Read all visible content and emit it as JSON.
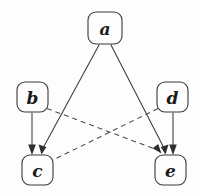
{
  "figure": {
    "type": "node-link-diagram",
    "background_color": "#fdfdfd",
    "stroke_color": "#3a3a3a",
    "width": 200,
    "height": 194
  },
  "nodes": [
    {
      "id": "a",
      "label": "a",
      "x": 105,
      "y": 28,
      "w": 34,
      "h": 32
    },
    {
      "id": "b",
      "label": "b",
      "x": 33,
      "y": 97,
      "w": 31,
      "h": 30
    },
    {
      "id": "d",
      "label": "d",
      "x": 171,
      "y": 97,
      "w": 31,
      "h": 30
    },
    {
      "id": "c",
      "label": "c",
      "x": 37,
      "y": 170,
      "w": 31,
      "h": 30
    },
    {
      "id": "e",
      "label": "e",
      "x": 170,
      "y": 170,
      "w": 31,
      "h": 30
    }
  ],
  "edges": [
    {
      "from": "a",
      "to": "c",
      "style": "solid",
      "arrow": true,
      "x1": 99,
      "y1": 45,
      "x2": 43,
      "y2": 152
    },
    {
      "from": "a",
      "to": "e",
      "style": "solid",
      "arrow": true,
      "x1": 111,
      "y1": 45,
      "x2": 164,
      "y2": 152
    },
    {
      "from": "b",
      "to": "c",
      "style": "solid",
      "arrow": true,
      "x1": 32,
      "y1": 113,
      "x2": 32,
      "y2": 152
    },
    {
      "from": "d",
      "to": "e",
      "style": "solid",
      "arrow": true,
      "x1": 173,
      "y1": 113,
      "x2": 173,
      "y2": 152
    },
    {
      "from": "b",
      "to": "e",
      "style": "dashed",
      "arrow": true,
      "x1": 48,
      "y1": 109,
      "x2": 158,
      "y2": 153
    },
    {
      "from": "d",
      "to": "c",
      "style": "dashed",
      "arrow": false,
      "x1": 157,
      "y1": 109,
      "x2": 54,
      "y2": 160
    }
  ],
  "legend": {
    "solid_meaning": "directed edge",
    "dashed_meaning": "crossed directed edge"
  }
}
